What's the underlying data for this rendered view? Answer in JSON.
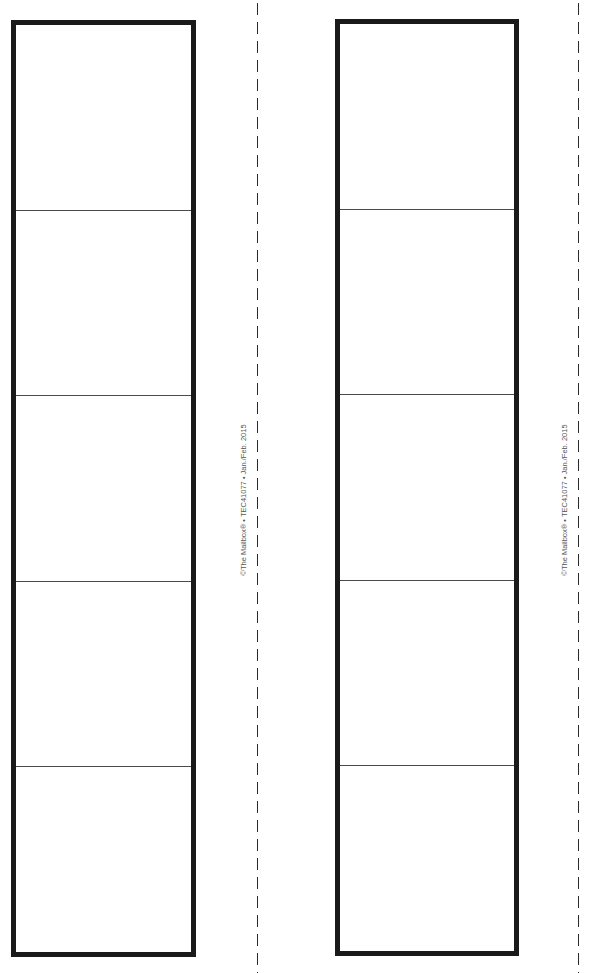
{
  "page": {
    "type": "printable-strip-template",
    "colors": {
      "border": "#1a1a1a",
      "divider": "#4a4a4a",
      "cut_line": "#2a2a2a",
      "credit_text": "#555555",
      "background": "#ffffff"
    }
  },
  "strips": [
    {
      "cells": 5,
      "credit": "©The Mailbox® • TEC41077 • Jan./Feb. 2015"
    },
    {
      "cells": 5,
      "credit": "©The Mailbox® • TEC41077 • Jan./Feb. 2015"
    }
  ]
}
